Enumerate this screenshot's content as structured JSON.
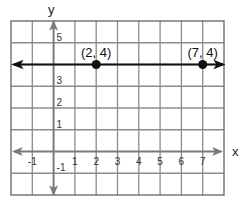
{
  "chart_data": {
    "type": "line",
    "title": "",
    "xlabel": "x",
    "ylabel": "y",
    "xlim": [
      -2,
      8
    ],
    "ylim": [
      -2,
      6
    ],
    "grid": true,
    "x_ticks": [
      -1,
      1,
      2,
      3,
      4,
      5,
      6,
      7
    ],
    "y_ticks": [
      -1,
      1,
      2,
      3,
      5
    ],
    "x_tick_labels": [
      "-1",
      "1",
      "2",
      "3",
      "4",
      "5",
      "6",
      "7"
    ],
    "y_tick_labels": [
      "-1",
      "1",
      "2",
      "3",
      "5"
    ],
    "series": [
      {
        "name": "horizontal line y = 4",
        "type": "line",
        "x": [
          -2,
          8
        ],
        "y": [
          4,
          4
        ],
        "arrows": "both",
        "color": "#111111"
      },
      {
        "name": "labeled points",
        "type": "scatter",
        "x": [
          2,
          7
        ],
        "y": [
          4,
          4
        ],
        "labels": [
          "(2, 4)",
          "(7, 4)"
        ],
        "color": "#111111"
      }
    ],
    "annotations": [
      "(2, 4)",
      "(7, 4)"
    ],
    "colors": {
      "grid": "#8c8c8c",
      "axes": "#7a7a7a",
      "line": "#111111",
      "background": "#ffffff"
    }
  },
  "labels": {
    "x_axis": "x",
    "y_axis": "y",
    "point_a": "(2, 4)",
    "point_b": "(7, 4)"
  }
}
